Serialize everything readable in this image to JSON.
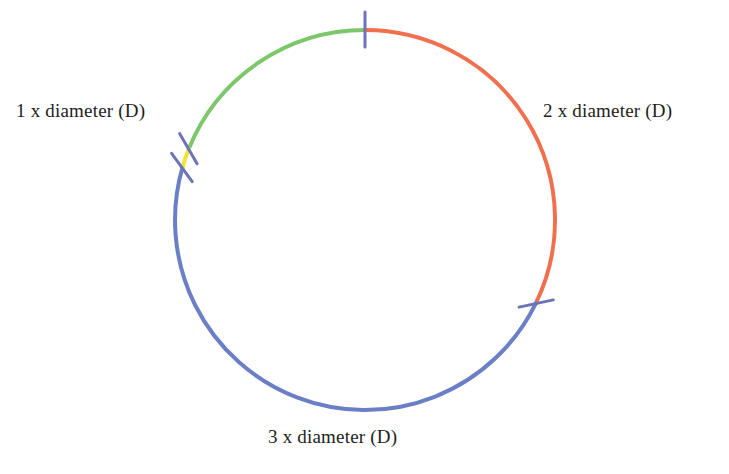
{
  "figure": {
    "type": "circle-segment-diagram",
    "background_color": "#ffffff",
    "text_color": "#1d1d1d",
    "circle": {
      "center_x": 365,
      "center_y": 220,
      "radius": 190,
      "stroke_width": 4
    }
  },
  "labels": {
    "left": "1 x diameter (D)",
    "right": "2 x diameter (D)",
    "bottom": "3 x diameter (D)"
  },
  "chart_data": {
    "type": "pie",
    "title": "",
    "xlabel": "",
    "ylabel": "",
    "legend_position": "around-arcs",
    "categories": [
      "1 x diameter (D)",
      "2 x diameter (D)",
      "3 x diameter (D)",
      "gap"
    ],
    "values": [
      1,
      2,
      3,
      0.12
    ],
    "labels": [
      "1 x diameter (D)",
      "2 x diameter (D)",
      "3 x diameter (D)",
      ""
    ],
    "colors": [
      "#7CC76A",
      "#F0704E",
      "#6B7FC7",
      "#F2E338"
    ],
    "annotations": [
      "1 x diameter (D)",
      "2 x diameter (D)",
      "3 x diameter (D)"
    ]
  },
  "arcs": [
    {
      "name": "arc-green-one-diameter",
      "color": "#7CC76A",
      "start_angle_deg": 202,
      "end_angle_deg": 270,
      "label": "1 x diameter (D)"
    },
    {
      "name": "arc-orange-two-diameter",
      "color": "#F0704E",
      "start_angle_deg": 270,
      "end_angle_deg": 386,
      "label": "2 x diameter (D)"
    },
    {
      "name": "arc-blue-three-diameter",
      "color": "#6B7FC7",
      "start_angle_deg": 26,
      "end_angle_deg": 196,
      "label": "3 x diameter (D)"
    },
    {
      "name": "arc-yellow-gap",
      "color": "#F2E338",
      "start_angle_deg": 196,
      "end_angle_deg": 202,
      "label": ""
    }
  ],
  "ticks": [
    {
      "name": "tick-top",
      "color": "#6B74B8",
      "angle_deg": 270,
      "orientation": "vertical"
    },
    {
      "name": "tick-lower-right",
      "color": "#6B74B8",
      "angle_deg": 26,
      "orientation": "diagonal"
    },
    {
      "name": "tick-lower-left-upper",
      "color": "#6B74B8",
      "angle_deg": 202,
      "orientation": "diagonal"
    },
    {
      "name": "tick-lower-left-lower",
      "color": "#6B74B8",
      "angle_deg": 196,
      "orientation": "diagonal"
    }
  ]
}
